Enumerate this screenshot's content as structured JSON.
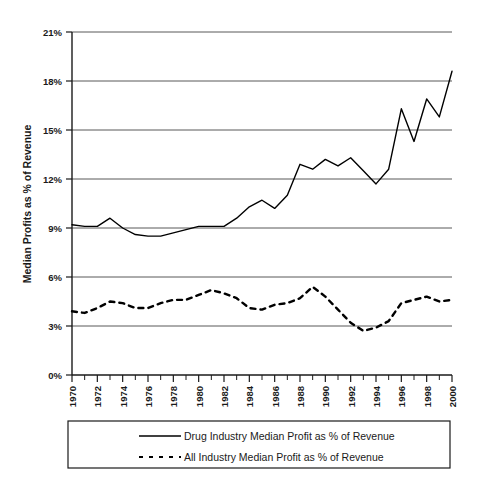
{
  "chart_data": {
    "type": "line",
    "title": "",
    "xlabel": "",
    "ylabel": "Median Profits as % of Revenue",
    "xlim": [
      1970,
      2000
    ],
    "ylim": [
      0,
      21
    ],
    "grid": true,
    "grid_axis": "y",
    "legend_position": "bottom",
    "y_ticks": [
      "0%",
      "3%",
      "6%",
      "9%",
      "12%",
      "15%",
      "18%",
      "21%"
    ],
    "y_tick_values": [
      0,
      3,
      6,
      9,
      12,
      15,
      18,
      21
    ],
    "x_ticks": [
      "1970",
      "1972",
      "1974",
      "1976",
      "1978",
      "1980",
      "1982",
      "1984",
      "1986",
      "1988",
      "1990",
      "1992",
      "1994",
      "1996",
      "1998",
      "2000"
    ],
    "x_tick_values": [
      1970,
      1972,
      1974,
      1976,
      1978,
      1980,
      1982,
      1984,
      1986,
      1988,
      1990,
      1992,
      1994,
      1996,
      1998,
      2000
    ],
    "x": [
      1970,
      1971,
      1972,
      1973,
      1974,
      1975,
      1976,
      1977,
      1978,
      1979,
      1980,
      1981,
      1982,
      1983,
      1984,
      1985,
      1986,
      1987,
      1988,
      1989,
      1990,
      1991,
      1992,
      1993,
      1994,
      1995,
      1996,
      1997,
      1998,
      1999,
      2000
    ],
    "series": [
      {
        "name": "Drug Industry Median Profit as % of Revenue",
        "style": "solid",
        "color": "#000000",
        "values": [
          9.2,
          9.1,
          9.1,
          9.6,
          9.0,
          8.6,
          8.5,
          8.5,
          8.7,
          8.9,
          9.1,
          9.1,
          9.1,
          9.6,
          10.3,
          10.7,
          10.2,
          11.0,
          12.9,
          12.6,
          13.2,
          12.8,
          13.3,
          12.5,
          11.7,
          12.6,
          16.3,
          14.3,
          16.9,
          15.8,
          18.6
        ]
      },
      {
        "name": "All Industry Median Profit as % of Revenue",
        "style": "dashed",
        "color": "#000000",
        "values": [
          3.9,
          3.8,
          4.1,
          4.5,
          4.4,
          4.1,
          4.1,
          4.4,
          4.6,
          4.6,
          4.9,
          5.2,
          5.0,
          4.7,
          4.1,
          4.0,
          4.3,
          4.4,
          4.7,
          5.4,
          4.8,
          4.0,
          3.2,
          2.7,
          2.9,
          3.3,
          4.4,
          4.6,
          4.8,
          4.5,
          4.6
        ]
      }
    ]
  },
  "axis": {
    "y_title": "Median Profits as % of Revenue"
  },
  "legend": {
    "items": [
      {
        "label": "Drug Industry Median Profit as % of Revenue",
        "marker": "solid-line-swatch"
      },
      {
        "label": "All Industry Median Profit as % of Revenue",
        "marker": "dashed-line-swatch"
      }
    ]
  }
}
